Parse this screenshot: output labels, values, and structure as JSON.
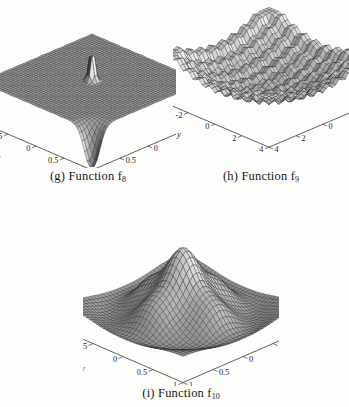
{
  "figure": {
    "kind": "three-panel 3D surface mesh figure",
    "background_color": "#fdfdfb",
    "ink_color": "#232323"
  },
  "panels": [
    {
      "id": "g",
      "caption_prefix": "(g) Function f",
      "caption_subscript": "8",
      "caption_full": "(g) Function f8"
    },
    {
      "id": "h",
      "caption_prefix": "(h) Function f",
      "caption_subscript": "9",
      "caption_full": "(h) Function f9"
    },
    {
      "id": "i",
      "caption_prefix": "(i) Function f",
      "caption_subscript": "10",
      "caption_full": "(i) Function f10"
    }
  ],
  "chart_data": [
    {
      "type": "surface",
      "panel": "g",
      "title": "(g) Function f8",
      "xlabel": "x",
      "ylabel": "y",
      "zlabel": "",
      "xlim": [
        -1,
        1
      ],
      "ylim": [
        -1,
        1
      ],
      "zlim": [
        -1.25e-10,
        1.25e-10
      ],
      "x_ticks": [
        1,
        0.5,
        0,
        -0.5,
        -1
      ],
      "x_tick_labels": [
        "1",
        "0.5",
        "0",
        "-0.5",
        "-1"
      ],
      "y_ticks": [
        -1,
        -0.5,
        0,
        0.5,
        1
      ],
      "y_tick_labels": [
        "-1",
        "-0.5",
        "0",
        "0.5",
        "1"
      ],
      "z_ticks": [
        1e-10,
        5e-11,
        0,
        -5e-11,
        -1e-10
      ],
      "z_tick_labels": [
        "1e-10",
        "5e-11",
        "0",
        "-5e-11",
        "-1e-10"
      ],
      "grid": false,
      "legend": "none",
      "mesh": {
        "u_divisions": 44,
        "v_divisions": 44,
        "wire_color": "#2b2b2b",
        "face_color": "#b4b4b4"
      },
      "surface_kind": "flat-plateau-with-central-spike-and-front-pit",
      "z_scale": 1e-10,
      "description": "Near-zero flat plateau with a sharp narrow positive spike at the centre-rear and a deep narrow negative spike at the front corner; values on the order of 1e-10."
    },
    {
      "type": "surface",
      "panel": "h",
      "title": "(h) Function f9",
      "xlabel": "x",
      "ylabel": "y",
      "zlabel": "",
      "xlim": [
        -5,
        5
      ],
      "ylim": [
        -5,
        5
      ],
      "zlim": [
        0,
        900
      ],
      "x_ticks": [
        4,
        2,
        0,
        -2,
        -4
      ],
      "x_tick_labels": [
        "4",
        "2",
        "0",
        "-2",
        "-4"
      ],
      "y_ticks": [
        -4,
        -2,
        0,
        2,
        4
      ],
      "y_tick_labels": [
        "-4",
        "-2",
        "0",
        "2",
        "4"
      ],
      "z_ticks": [
        800,
        600,
        400,
        200,
        0
      ],
      "z_tick_labels": [
        "000",
        "600",
        "400",
        "200",
        "0"
      ],
      "grid": false,
      "legend": "none",
      "mesh": {
        "u_divisions": 34,
        "v_divisions": 34,
        "wire_color": "#2b2b2b",
        "face_color": "#b0b0b0"
      },
      "surface_kind": "rastrigin-like-bowl-with-ripples",
      "z_scale": 900,
      "description": "Broad bowl rising toward the four corners with regular sinusoidal ripples; minimum near the centre, corner peaks approaching 800-900."
    },
    {
      "type": "surface",
      "panel": "i",
      "title": "(i) Function f10",
      "xlabel": "x",
      "ylabel": "y",
      "zlabel": "",
      "xlim": [
        -1,
        1
      ],
      "ylim": [
        -1,
        1
      ],
      "zlim": [
        -125,
        225
      ],
      "x_ticks": [
        1,
        0.5,
        0,
        -0.5,
        -1
      ],
      "x_tick_labels": [
        "1",
        "0.5",
        "0",
        "-0.5",
        "-1"
      ],
      "y_ticks": [
        -1,
        -0.5,
        0,
        0.5,
        1
      ],
      "y_tick_labels": [
        "-1",
        "-0.5",
        "0",
        "0.5",
        "1"
      ],
      "z_ticks": [
        200,
        150,
        100,
        50,
        0,
        -50,
        -100
      ],
      "z_tick_labels": [
        "200",
        "150",
        "100",
        "50",
        "0",
        "-50",
        "-100"
      ],
      "grid": false,
      "legend": "none",
      "mesh": {
        "u_divisions": 36,
        "v_divisions": 36,
        "wire_color": "#2b2b2b",
        "face_color": "#b0b0b0"
      },
      "surface_kind": "central-tall-peak-with-concentric-side-lobes",
      "z_scale": 200,
      "description": "Tall single central peak reaching about 200, surrounded by a ring of four secondary lobes near 100 and a negative trough ring near -50 to -100."
    }
  ]
}
